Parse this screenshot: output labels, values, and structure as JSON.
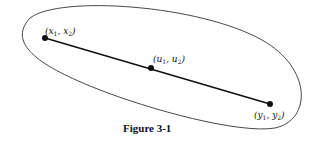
{
  "figure": {
    "caption": "Figure 3-1",
    "points": [
      {
        "name": "x",
        "label_open": "(x",
        "sub1": "1",
        "mid": ", x",
        "sub2": "2",
        "label_close": ")"
      },
      {
        "name": "u",
        "label_open": "(u",
        "sub1": "1",
        "mid": ", u",
        "sub2": "2",
        "label_close": ")"
      },
      {
        "name": "y",
        "label_open": "(y",
        "sub1": "1",
        "mid": ", y",
        "sub2": "2",
        "label_close": ")"
      }
    ]
  }
}
